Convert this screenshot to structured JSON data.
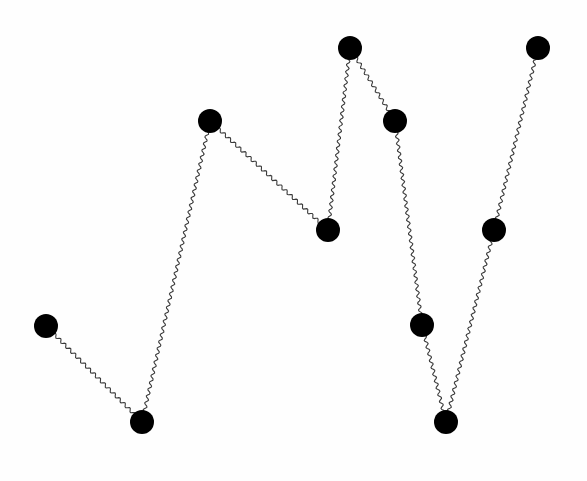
{
  "diagram": {
    "type": "graph",
    "width": 587,
    "height": 481,
    "background": "#fefefe",
    "node_color": "#000000",
    "edge_color": "#3a3a3a",
    "edge_style": "wavy",
    "node_radius": 12,
    "nodes": [
      {
        "id": "n1",
        "x": 46,
        "y": 326
      },
      {
        "id": "n2",
        "x": 142,
        "y": 422
      },
      {
        "id": "n3",
        "x": 210,
        "y": 121
      },
      {
        "id": "n4",
        "x": 328,
        "y": 230
      },
      {
        "id": "n5",
        "x": 350,
        "y": 48
      },
      {
        "id": "n6",
        "x": 395,
        "y": 121
      },
      {
        "id": "n7",
        "x": 422,
        "y": 325
      },
      {
        "id": "n8",
        "x": 446,
        "y": 422
      },
      {
        "id": "n9",
        "x": 494,
        "y": 230
      },
      {
        "id": "n10",
        "x": 538,
        "y": 48
      }
    ],
    "edges": [
      {
        "from": "n1",
        "to": "n2"
      },
      {
        "from": "n2",
        "to": "n3"
      },
      {
        "from": "n3",
        "to": "n4"
      },
      {
        "from": "n4",
        "to": "n5"
      },
      {
        "from": "n5",
        "to": "n6"
      },
      {
        "from": "n6",
        "to": "n7"
      },
      {
        "from": "n7",
        "to": "n8"
      },
      {
        "from": "n8",
        "to": "n9"
      },
      {
        "from": "n9",
        "to": "n10"
      }
    ]
  }
}
